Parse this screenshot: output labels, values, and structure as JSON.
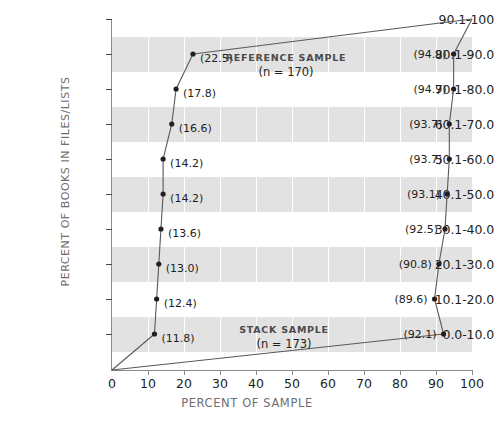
{
  "chart_data": {
    "type": "line",
    "title": "",
    "xlabel": "PERCENT OF SAMPLE",
    "ylabel": "PERCENT OF BOOKS IN FILES/LISTS",
    "xlim": [
      0,
      100
    ],
    "xticks": [
      "0",
      "10",
      "20",
      "30",
      "40",
      "50",
      "60",
      "70",
      "80",
      "90",
      "100"
    ],
    "xtick_values": [
      0,
      10,
      20,
      30,
      40,
      50,
      60,
      70,
      80,
      90,
      100
    ],
    "categories": [
      "0.0-10.0",
      "10.1-20.0",
      "20.1-30.0",
      "30.1-40.0",
      "40.1-50.0",
      "50.1-60.0",
      "60.1-70.0",
      "70.1-80.0",
      "80.1-90.0",
      "90.1-100"
    ],
    "grid": "horizontal-bands",
    "legend_position": "inline-annotations",
    "series": [
      {
        "name": "REFERENCE SAMPLE",
        "n_label": "(n = 170)",
        "n": 170,
        "labels": [
          "(11.8)",
          "(12.4)",
          "(13.0)",
          "(13.6)",
          "(14.2)",
          "(14.2)",
          "(16.6)",
          "(17.8)",
          "(22.5)",
          ""
        ],
        "values": [
          11.8,
          12.4,
          13.0,
          13.6,
          14.2,
          14.2,
          16.6,
          17.8,
          22.5,
          100
        ]
      },
      {
        "name": "STACK SAMPLE",
        "n_label": "(n = 173)",
        "n": 173,
        "labels": [
          "(92.1)",
          "(89.6)",
          "(90.8)",
          "(92.5)",
          "(93.1)",
          "(93.7)",
          "(93.7)",
          "(94.9)",
          "(94.9)",
          ""
        ],
        "values": [
          92.1,
          89.6,
          90.8,
          92.5,
          93.1,
          93.7,
          93.7,
          94.9,
          94.9,
          100
        ]
      }
    ],
    "annotations": [
      {
        "text": "REFERENCE SAMPLE",
        "sub": "(n = 170)"
      },
      {
        "text": "STACK SAMPLE",
        "sub": "(n = 173)"
      }
    ],
    "colors": {
      "band": "#e2e2e2",
      "line": "#58595b",
      "point": "#231f20",
      "axis": "#8a8a8a",
      "label": "#231f20",
      "axis_title": "#6f6f6f",
      "background": "#ffffff"
    }
  }
}
